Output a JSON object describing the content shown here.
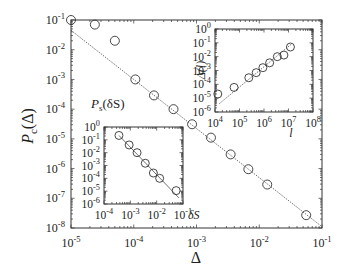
{
  "chart_data": [
    {
      "id": "main",
      "type": "scatter",
      "title": "",
      "xlabel": "Δ",
      "ylabel": "P_c(Δ)",
      "xscale": "log",
      "yscale": "log",
      "xlim": [
        1e-05,
        0.1
      ],
      "ylim": [
        1e-08,
        0.1
      ],
      "xticks": [
        "10^-5",
        "10^-4",
        "10^-3",
        "10^-2",
        "10^-1"
      ],
      "yticks": [
        "10^-1",
        "10^-2",
        "10^-3",
        "10^-4",
        "10^-5",
        "10^-6",
        "10^-7",
        "10^-8"
      ],
      "grid": false,
      "series": [
        {
          "name": "data",
          "marker": "open-circle",
          "x": [
            1e-05,
            2.4e-05,
            5e-05,
            0.000106,
            0.00021,
            0.00043,
            0.00085,
            0.0017,
            0.0035,
            0.0067,
            0.0134,
            0.056
          ],
          "y": [
            0.1,
            0.07,
            0.02,
            0.001,
            0.00029,
            0.0001,
            3.1e-05,
            1.1e-05,
            3e-06,
            9.5e-07,
            2.9e-07,
            2.7e-08
          ]
        },
        {
          "name": "power-law fit",
          "style": "dotted-line",
          "x": [
            1e-05,
            0.1
          ],
          "y": [
            0.045,
            1.1e-08
          ]
        }
      ],
      "insets": [
        {
          "id": "inset-delta-l",
          "type": "scatter",
          "xlabel": "l",
          "ylabel": "Δ(l)",
          "xscale": "log",
          "yscale": "log",
          "xlim": [
            10000.0,
            100000000.0
          ],
          "ylim": [
            1e-06,
            1.0
          ],
          "xticks": [
            "10^4",
            "10^5",
            "10^6",
            "10^7",
            "10^8"
          ],
          "yticks": [
            "10^0",
            "10^-1",
            "10^-2",
            "10^-3",
            "10^-4",
            "10^-5",
            "10^-6"
          ],
          "series": [
            {
              "name": "data",
              "marker": "open-circle",
              "x": [
                13000.0,
                60000.0,
                240000.0,
                480000.0,
                900000.0,
                1700000.0,
                3500000.0,
                6500000.0,
                12000000.0
              ],
              "y": [
                2e-05,
                6e-05,
                0.0003,
                0.0007,
                0.0016,
                0.0036,
                0.01,
                0.013,
                0.05
              ]
            },
            {
              "name": "power-law fit",
              "style": "dotted-line",
              "x": [
                15000.0,
                13000000.0
              ],
              "y": [
                4e-06,
                0.08
              ]
            }
          ]
        },
        {
          "id": "inset-ps",
          "type": "scatter",
          "xlabel": "δS",
          "ylabel": "P_s(δS)",
          "xscale": "log",
          "yscale": "log",
          "xlim": [
            0.0001,
            0.1
          ],
          "ylim": [
            1e-06,
            1.0
          ],
          "xticks": [
            "10^-4",
            "10^-3",
            "10^-2",
            "10^-1"
          ],
          "yticks": [
            "10^0",
            "10^-1",
            "10^-2",
            "10^-3",
            "10^-4",
            "10^-5",
            "10^-6"
          ],
          "series": [
            {
              "name": "data",
              "marker": "open-circle",
              "x": [
                0.00037,
                0.0009,
                0.0018,
                0.0037,
                0.0075,
                0.013,
                0.055
              ],
              "y": [
                0.22,
                0.04,
                0.01,
                0.0015,
                0.00026,
                0.0001,
                1.1e-05
              ]
            },
            {
              "name": "power-law fit",
              "style": "solid-line",
              "x": [
                0.00037,
                0.07
              ],
              "y": [
                0.22,
                3e-06
              ]
            }
          ]
        }
      ]
    }
  ],
  "labels": {
    "main_xlabel": "Δ",
    "main_ylabel_P": "P",
    "main_ylabel_sub": "c",
    "main_ylabel_arg": "(Δ)",
    "inset1_ylabel": "Δ(l)",
    "inset1_xlabel": "l",
    "inset2_ylabel_P": "P",
    "inset2_ylabel_sub": "s",
    "inset2_ylabel_arg": "(δS)",
    "inset2_xlabel": "δS"
  }
}
